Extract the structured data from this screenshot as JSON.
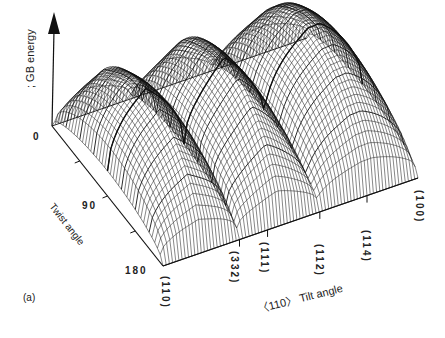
{
  "figure": {
    "panel_label": "(a)",
    "z_axis_label": "; GB energy",
    "z_origin_label": "0",
    "twist_axis": {
      "label": "Twist angle",
      "ticks": [
        "90",
        "180"
      ]
    },
    "tilt_axis": {
      "label": "〈110〉 Tilt angle",
      "ticks": [
        "(110)",
        "(332)",
        "(111)",
        "(112)",
        "(114)",
        "(100)"
      ]
    }
  },
  "chart_data": {
    "type": "surface3d",
    "title": "",
    "xlabel": "〈110〉 Tilt angle",
    "ylabel": "Twist angle",
    "zlabel": "GB energy",
    "x_ticks": [
      "(110)",
      "(332)",
      "(111)",
      "(112)",
      "(114)",
      "(100)"
    ],
    "y_ticks": [
      "0",
      "90",
      "180"
    ],
    "z_ticks": [
      "0"
    ],
    "tilt_cusps": [
      "(110)",
      "(332)",
      "(112)",
      "(100)"
    ]
  }
}
